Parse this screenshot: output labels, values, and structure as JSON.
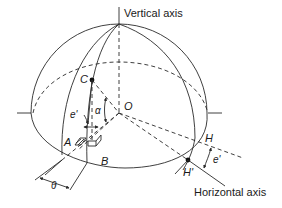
{
  "figure": {
    "type": "geometric-diagram",
    "colors": {
      "line": "#2a2a2a",
      "text": "#1a1a1a",
      "background": "#ffffff"
    }
  },
  "labels": {
    "vertical_axis": "Vertical axis",
    "horizontal_axis": "Horizontal axis",
    "point_C": "C",
    "point_O": "O",
    "point_A": "A",
    "point_B": "B",
    "point_H": "H",
    "point_H_prime": "H'",
    "angle_e_prime_left": "e'",
    "angle_alpha": "α",
    "angle_e_prime_right": "e'",
    "angle_theta": "θ"
  }
}
